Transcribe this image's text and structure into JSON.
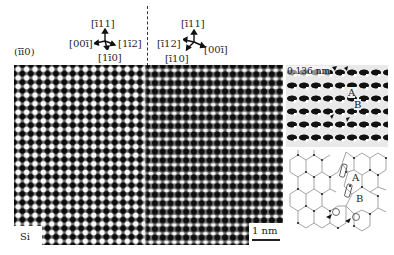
{
  "figure": {
    "panel_left_label": {
      "pre": "(",
      "a": "1",
      "b": "1",
      "c": "0)",
      "display": "(īī0)"
    },
    "left_orientation": {
      "up": "[ī11]",
      "left": "[00ī]",
      "right": "[1ī2]",
      "down": "[1ī0]"
    },
    "right_orientation": {
      "up": "[ī11]",
      "left": "[ī12]",
      "right": "[00ī]",
      "down": "[ī10]"
    },
    "main_image": {
      "material_label": "Si",
      "scale_bar_label": "1 nm",
      "description": "HRTEM lattice image with vertical twin/grain boundary"
    },
    "inset_top": {
      "spacing_label": "0.136 nm",
      "marker_a": "A",
      "marker_b": "B"
    },
    "inset_diagram": {
      "marker_a": "A",
      "marker_b": "B",
      "description": "atomic structure model of boundary"
    },
    "colors": {
      "background": "#ffffff",
      "text": "#2a2a2a",
      "lattice_dark": "#0a0a0a",
      "lattice_light": "#fafafa",
      "diagram_line": "#999999",
      "diagram_atom": "#222222"
    }
  }
}
